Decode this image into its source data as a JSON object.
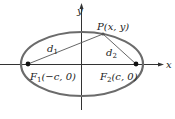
{
  "diagram": {
    "axes": {
      "x_label": "x",
      "y_label": "y"
    },
    "point": {
      "name": "P",
      "label": "P(x, y)"
    },
    "foci": [
      {
        "name": "F1",
        "label_main": "F",
        "label_sub": "1",
        "label_coords": "(−c, 0)"
      },
      {
        "name": "F2",
        "label_main": "F",
        "label_sub": "2",
        "label_coords": "(c, 0)"
      }
    ],
    "distances": [
      {
        "name": "d1",
        "main": "d",
        "sub": "1"
      },
      {
        "name": "d2",
        "main": "d",
        "sub": "2"
      }
    ],
    "colors": {
      "ellipse": "#6b6b6b",
      "axis": "#333333",
      "lines": "#555555"
    }
  }
}
